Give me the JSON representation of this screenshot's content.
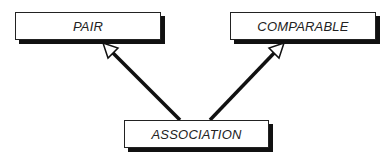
{
  "diagram": {
    "type": "class-inheritance",
    "nodes": [
      {
        "id": "pair",
        "label": "PAIR"
      },
      {
        "id": "comparable",
        "label": "COMPARABLE"
      },
      {
        "id": "association",
        "label": "ASSOCIATION"
      }
    ],
    "edges": [
      {
        "from": "association",
        "to": "pair",
        "arrow": "hollow-triangle"
      },
      {
        "from": "association",
        "to": "comparable",
        "arrow": "hollow-triangle"
      }
    ]
  }
}
